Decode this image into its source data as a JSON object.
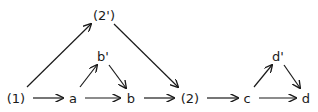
{
  "diagram": {
    "type": "directed-graph",
    "colors": {
      "ink": "#1a1a1a",
      "background": "#ffffff"
    },
    "nodes": [
      {
        "id": "n1",
        "label": "(1)",
        "x": 16,
        "y": 99
      },
      {
        "id": "a",
        "label": "a",
        "x": 73,
        "y": 99
      },
      {
        "id": "b",
        "label": "b",
        "x": 131,
        "y": 99
      },
      {
        "id": "n2",
        "label": "(2)",
        "x": 190,
        "y": 99
      },
      {
        "id": "c",
        "label": "c",
        "x": 247,
        "y": 99
      },
      {
        "id": "d",
        "label": "d",
        "x": 306,
        "y": 99
      },
      {
        "id": "n2p",
        "label": "(2')",
        "x": 104,
        "y": 16
      },
      {
        "id": "bp",
        "label": "b'",
        "x": 103,
        "y": 57
      },
      {
        "id": "dp",
        "label": "d'",
        "x": 278,
        "y": 57
      }
    ],
    "edges": [
      {
        "from": "n1",
        "to": "a",
        "x1": 33,
        "y1": 98,
        "x2": 63,
        "y2": 98
      },
      {
        "from": "a",
        "to": "b",
        "x1": 85,
        "y1": 98,
        "x2": 120,
        "y2": 98
      },
      {
        "from": "b",
        "to": "n2",
        "x1": 144,
        "y1": 98,
        "x2": 174,
        "y2": 98
      },
      {
        "from": "n2",
        "to": "c",
        "x1": 207,
        "y1": 98,
        "x2": 238,
        "y2": 98
      },
      {
        "from": "c",
        "to": "d",
        "x1": 259,
        "y1": 98,
        "x2": 296,
        "y2": 98
      },
      {
        "from": "n1",
        "to": "n2p",
        "x1": 27,
        "y1": 87,
        "x2": 91,
        "y2": 24
      },
      {
        "from": "n2p",
        "to": "n2",
        "x1": 114,
        "y1": 24,
        "x2": 178,
        "y2": 87
      },
      {
        "from": "a",
        "to": "bp",
        "x1": 80,
        "y1": 87,
        "x2": 97,
        "y2": 65
      },
      {
        "from": "bp",
        "to": "b",
        "x1": 109,
        "y1": 65,
        "x2": 126,
        "y2": 88
      },
      {
        "from": "c",
        "to": "dp",
        "x1": 254,
        "y1": 87,
        "x2": 272,
        "y2": 65
      },
      {
        "from": "dp",
        "to": "d",
        "x1": 284,
        "y1": 65,
        "x2": 300,
        "y2": 88
      }
    ]
  }
}
